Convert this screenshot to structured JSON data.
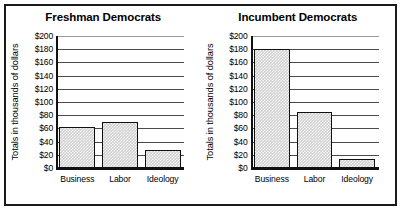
{
  "figure": {
    "panels": [
      {
        "title": "Freshman Democrats",
        "ylabel": "Totals in thousands of dollars",
        "ticks": [
          "$200",
          "$180",
          "$160",
          "$140",
          "$120",
          "$100",
          "$80",
          "$60",
          "$40",
          "$20",
          "$0"
        ],
        "categories": [
          "Business",
          "Labor",
          "Ideology"
        ]
      },
      {
        "title": "Incumbent Democrats",
        "ylabel": "Totals in thousands of dollars",
        "ticks": [
          "$200",
          "$180",
          "$160",
          "$140",
          "$120",
          "$100",
          "$80",
          "$60",
          "$40",
          "$20",
          "$0"
        ],
        "categories": [
          "Business",
          "Labor",
          "Ideology"
        ]
      }
    ]
  },
  "chart_data": [
    {
      "type": "bar",
      "title": "Freshman Democrats",
      "xlabel": "",
      "ylabel": "Totals in thousands of dollars",
      "categories": [
        "Business",
        "Labor",
        "Ideology"
      ],
      "values": [
        62,
        70,
        27
      ],
      "ylim": [
        0,
        200
      ],
      "yticks": [
        0,
        20,
        40,
        60,
        80,
        100,
        120,
        140,
        160,
        180,
        200
      ],
      "ytick_labels": [
        "$0",
        "$20",
        "$40",
        "$60",
        "$80",
        "$100",
        "$120",
        "$140",
        "$160",
        "$180",
        "$200"
      ],
      "grid": true,
      "legend": "none",
      "bar_fill_color": "#d2d2d2",
      "bar_edge_color": "#111111"
    },
    {
      "type": "bar",
      "title": "Incumbent Democrats",
      "xlabel": "",
      "ylabel": "Totals in thousands of dollars",
      "categories": [
        "Business",
        "Labor",
        "Ideology"
      ],
      "values": [
        180,
        85,
        13
      ],
      "ylim": [
        0,
        200
      ],
      "yticks": [
        0,
        20,
        40,
        60,
        80,
        100,
        120,
        140,
        160,
        180,
        200
      ],
      "ytick_labels": [
        "$0",
        "$20",
        "$40",
        "$60",
        "$80",
        "$100",
        "$120",
        "$140",
        "$160",
        "$180",
        "$200"
      ],
      "grid": true,
      "legend": "none",
      "bar_fill_color": "#d2d2d2",
      "bar_edge_color": "#111111"
    }
  ]
}
